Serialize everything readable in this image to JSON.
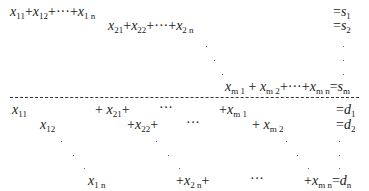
{
  "top_block": {
    "row1": {
      "lhs": [
        "x",
        "11",
        "+",
        "x",
        "12",
        "+···+",
        "x",
        "1 n"
      ],
      "rhs_var": "s",
      "rhs_sub": "1"
    },
    "row2": {
      "lhs": [
        "x",
        "21",
        "+",
        "x",
        "22",
        "+···+",
        "x",
        "2 n"
      ],
      "rhs_var": "s",
      "rhs_sub": "2"
    },
    "rowm": {
      "terms": [
        {
          "v": "x",
          "s": "m 1"
        },
        {
          "v": "x",
          "s": "m 2"
        },
        {
          "v": "x",
          "s": "m n"
        }
      ],
      "rhs_var": "s",
      "rhs_sub": "m"
    }
  },
  "bottom_block": {
    "col1": [
      {
        "v": "x",
        "s": "11"
      },
      {
        "v": "x",
        "s": "12"
      },
      {
        "v": "x",
        "s": "1 n"
      }
    ],
    "col2": [
      {
        "v": "x",
        "s": "21"
      },
      {
        "v": "x",
        "s": "22"
      },
      {
        "v": "x",
        "s": "2 n"
      }
    ],
    "colm": [
      {
        "v": "x",
        "s": "m 1"
      },
      {
        "v": "x",
        "s": "m 2"
      },
      {
        "v": "x",
        "s": "m n"
      }
    ],
    "rhs": [
      {
        "v": "d",
        "s": "1"
      },
      {
        "v": "d",
        "s": "2"
      },
      {
        "v": "d",
        "s": "n"
      }
    ]
  },
  "symbols": {
    "plus": "+",
    "equals": "=",
    "ellipsis": "···",
    "plus_ellipsis_plus": "+···+"
  }
}
